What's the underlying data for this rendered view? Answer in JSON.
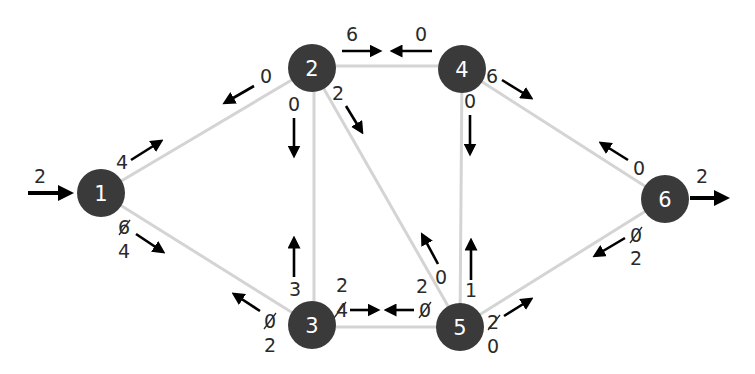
{
  "diagram": {
    "type": "flow-network",
    "colors": {
      "node_fill": "#3a3a3a",
      "node_text": "#ffffff",
      "edge": "#d4d4d4",
      "arrow": "#000000",
      "label": "#2a2a2a"
    },
    "nodes": [
      {
        "id": "1",
        "label": "1",
        "x": 101,
        "y": 193
      },
      {
        "id": "2",
        "label": "2",
        "x": 312,
        "y": 68
      },
      {
        "id": "3",
        "label": "3",
        "x": 312,
        "y": 325
      },
      {
        "id": "4",
        "label": "4",
        "x": 462,
        "y": 69
      },
      {
        "id": "5",
        "label": "5",
        "x": 460,
        "y": 327
      },
      {
        "id": "6",
        "label": "6",
        "x": 665,
        "y": 199
      }
    ],
    "edges": [
      {
        "from": "1",
        "to": "2"
      },
      {
        "from": "1",
        "to": "3"
      },
      {
        "from": "2",
        "to": "3"
      },
      {
        "from": "2",
        "to": "4"
      },
      {
        "from": "2",
        "to": "5"
      },
      {
        "from": "3",
        "to": "5"
      },
      {
        "from": "4",
        "to": "5"
      },
      {
        "from": "4",
        "to": "6"
      },
      {
        "from": "5",
        "to": "6"
      }
    ],
    "external": {
      "source_in": "2",
      "sink_out": "2"
    },
    "flows": {
      "e12_fwd": "4",
      "e12_back": "0",
      "e13_fwd_old": "6",
      "e13_fwd": "4",
      "e13_back_old": "0",
      "e13_back": "2",
      "e23_fwd": "0",
      "e23_back": "3",
      "e24_fwd": "6",
      "e24_back": "0",
      "e25_fwd": "2",
      "e25_back": "0",
      "e35_fwd_top": "2",
      "e35_fwd": "4",
      "e35_back_top": "2",
      "e35_back": "0",
      "e45_fwd": "0",
      "e45_back": "1",
      "e46_fwd": "6",
      "e46_back": "0",
      "e56_fwd": "2",
      "e56_fwd_bottom": "0",
      "e56_back": "0",
      "e56_back_bottom": "2"
    }
  }
}
